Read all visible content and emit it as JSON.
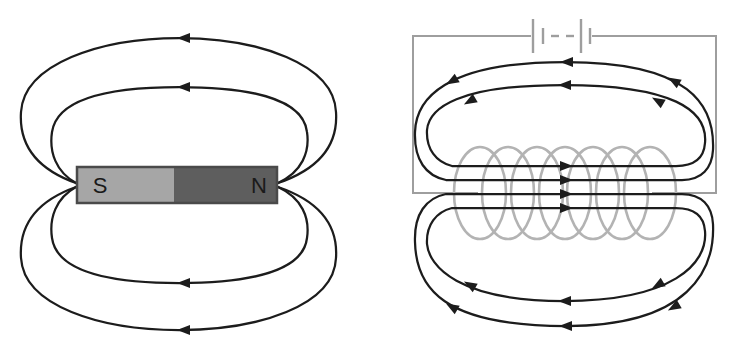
{
  "colors": {
    "background": "#ffffff",
    "field_line": "#1c1c1c",
    "arrow": "#1c1c1c",
    "coil": "#b3b3b3",
    "wire": "#9e9e9e",
    "magnet_south_fill": "#a6a6a6",
    "magnet_north_fill": "#5e5e5e",
    "magnet_border": "#4a4a4a",
    "pole_label": "#1a1a1a"
  },
  "left_diagram": {
    "type": "bar-magnet-field",
    "magnet": {
      "south_label": "S",
      "north_label": "N"
    },
    "field_loop_count": 4,
    "top_arrow_direction": "left",
    "bottom_arrow_direction": "left"
  },
  "right_diagram": {
    "type": "solenoid-electromagnet-field",
    "coil_turns": 7,
    "field_loop_count": 4,
    "center_field_line_count": 4,
    "center_arrow_direction": "right",
    "outer_arrow_direction": "left",
    "battery": {
      "icon": "battery-cells-icon",
      "cells": 2,
      "ellipsis_dashes": 2
    }
  }
}
